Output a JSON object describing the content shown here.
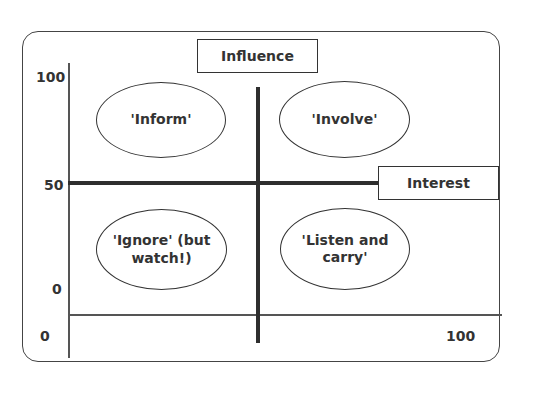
{
  "diagram": {
    "type": "stakeholder-influence-interest-matrix",
    "axes": {
      "vertical": {
        "label": "Influence",
        "ticks": [
          "100",
          "50",
          "0"
        ]
      },
      "horizontal": {
        "label": "Interest",
        "ticks": [
          "0",
          "100"
        ]
      }
    },
    "quadrants": [
      {
        "position": "top-left",
        "label": "'Inform'"
      },
      {
        "position": "top-right",
        "label": "'Involve'"
      },
      {
        "position": "bottom-left",
        "label": "'Ignore' (but watch!)"
      },
      {
        "position": "bottom-right",
        "label": "'Listen and carry'"
      }
    ],
    "colors": {
      "line": "#2e2e2e",
      "text": "#333333",
      "background": "#ffffff"
    }
  }
}
